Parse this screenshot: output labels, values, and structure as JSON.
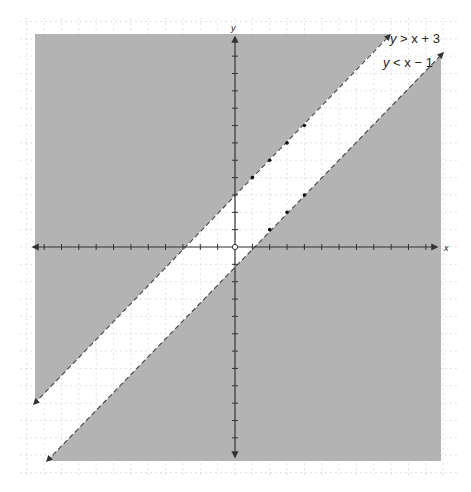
{
  "chart_data": {
    "type": "line",
    "title": "",
    "xlabel": "x",
    "ylabel": "y",
    "xlim": [
      -11.5,
      11.8
    ],
    "ylim": [
      -12.3,
      12.3
    ],
    "grid": true,
    "series": [
      {
        "name": "y > x + 3",
        "label": "y > x + 3",
        "equation": "y = x + 3",
        "line_style": "dashed",
        "shaded": "above",
        "points": [
          [
            1,
            4
          ],
          [
            2,
            5
          ],
          [
            3,
            6
          ],
          [
            4,
            7
          ]
        ]
      },
      {
        "name": "y < x - 1",
        "label": "y < x − 1",
        "equation": "y = x - 1",
        "line_style": "dashed",
        "shaded": "below",
        "points": [
          [
            2,
            1
          ],
          [
            3,
            2
          ],
          [
            4,
            3
          ]
        ]
      }
    ],
    "annotations": [
      "y > x + 3",
      "y < x − 1"
    ],
    "origin_marker": "open-circle"
  },
  "colors": {
    "shade": "#b3b3b3",
    "grid": "#d6d6d6",
    "axis": "#333333",
    "line": "#444444",
    "background": "#ffffff"
  },
  "labels": {
    "x_axis": "x",
    "y_axis": "y",
    "ineq1_y": "y",
    "ineq1_rest": " > x + 3",
    "ineq2_y": "y",
    "ineq2_rest": " < x − 1"
  }
}
